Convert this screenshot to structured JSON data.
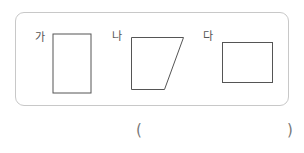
{
  "figures": [
    {
      "label": "가",
      "shape": "rectangle-tall"
    },
    {
      "label": "나",
      "shape": "trapezoid"
    },
    {
      "label": "다",
      "shape": "rectangle-wide"
    }
  ],
  "answer": {
    "open": "(",
    "close": ")",
    "value": ""
  },
  "colors": {
    "stroke": "#555555",
    "panel_border": "#c8c8c8"
  }
}
